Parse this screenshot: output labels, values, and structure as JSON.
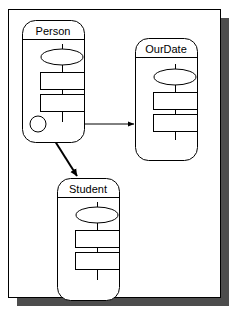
{
  "figure": {
    "kind": "uml-class-diagram-sheet",
    "background_color": "#ffffff",
    "page": {
      "name": "diagram-page",
      "fill_color": "#ffffff",
      "border_color": "#000000",
      "shadow_color": "#4d4d4d",
      "x": 8,
      "y": 9,
      "width": 212,
      "height": 288,
      "shadow_offset_x": 9,
      "shadow_offset_y": 9
    }
  },
  "classes": [
    {
      "id": "person",
      "label": "Person",
      "x": 22,
      "y": 20,
      "width": 62,
      "height": 122,
      "corner_radius": 13,
      "title_divider_y": 39,
      "stroke_color": "#000000",
      "fill_color": "#ffffff",
      "ellipse": {
        "cx": 62,
        "cy": 57,
        "rx": 21,
        "ry": 8
      },
      "attribute_boxes": [
        {
          "x": 40,
          "y": 72,
          "width": 44,
          "height": 17
        },
        {
          "x": 40,
          "y": 94,
          "width": 44,
          "height": 17
        }
      ],
      "stem_x": 62,
      "stem_top": 44,
      "stem_bottom": 122,
      "port_circle": {
        "cx": 38,
        "cy": 124,
        "r": 8
      }
    },
    {
      "id": "ourdate",
      "label": "OurDate",
      "x": 135,
      "y": 38,
      "width": 62,
      "height": 122,
      "corner_radius": 13,
      "title_divider_y": 57,
      "stroke_color": "#000000",
      "fill_color": "#ffffff",
      "ellipse": {
        "cx": 175,
        "cy": 77,
        "rx": 21,
        "ry": 8
      },
      "attribute_boxes": [
        {
          "x": 153,
          "y": 92,
          "width": 44,
          "height": 17
        },
        {
          "x": 153,
          "y": 114,
          "width": 44,
          "height": 17
        }
      ],
      "stem_x": 175,
      "stem_top": 64,
      "stem_bottom": 140
    },
    {
      "id": "student",
      "label": "Student",
      "x": 57,
      "y": 178,
      "width": 62,
      "height": 122,
      "corner_radius": 13,
      "title_divider_y": 197,
      "stroke_color": "#000000",
      "fill_color": "#ffffff",
      "ellipse": {
        "cx": 97,
        "cy": 215,
        "rx": 21,
        "ry": 8
      },
      "attribute_boxes": [
        {
          "x": 75,
          "y": 230,
          "width": 44,
          "height": 17
        },
        {
          "x": 75,
          "y": 252,
          "width": 44,
          "height": 17
        }
      ],
      "stem_x": 97,
      "stem_top": 202,
      "stem_bottom": 280
    }
  ],
  "connectors": [
    {
      "id": "person-to-ourdate",
      "from": "person",
      "to": "ourdate",
      "style": "thin-solid-arrow",
      "stroke_width": 1,
      "stroke_color": "#000000",
      "arrowhead": "solid-triangle",
      "x1": 38,
      "y1": 124,
      "x2": 134,
      "y2": 124
    },
    {
      "id": "person-to-student",
      "from": "person",
      "to": "student",
      "style": "thick-solid-arrow",
      "stroke_width": 2,
      "stroke_color": "#000000",
      "arrowhead": "solid-triangle",
      "x1": 53,
      "y1": 138,
      "x2": 77,
      "y2": 176
    }
  ]
}
